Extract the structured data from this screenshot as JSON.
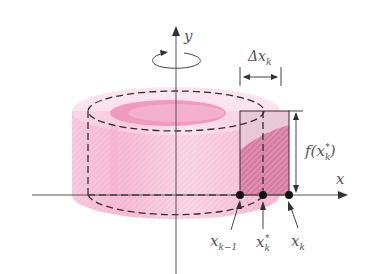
{
  "diagram": {
    "colors": {
      "shell_light": "#f6c6dc",
      "shell_mid": "#ef9fc2",
      "shell_dark": "#e77fae",
      "rect_fill": "#d98aa8",
      "rect_light": "#ebc6d4",
      "axis": "#444444",
      "dash": "#3a2a30",
      "label": "#555555"
    },
    "labels": {
      "y_axis": "y",
      "x_axis": "x",
      "delta_x": "Δx",
      "delta_x_sub": "k",
      "height_f": "f(x",
      "height_sub": "k",
      "height_sup": "*",
      "height_close": ")",
      "x_k_minus_1": "x",
      "x_k_minus_1_sub": "k−1",
      "x_k_star": "x",
      "x_k_star_sub": "k",
      "x_k_star_sup": "*",
      "x_k": "x",
      "x_k_sub": "k"
    },
    "points": [
      {
        "name": "x_k-1",
        "x": 240,
        "y": 195
      },
      {
        "name": "x_k*",
        "x": 263,
        "y": 195
      },
      {
        "name": "x_k",
        "x": 289,
        "y": 195
      }
    ]
  }
}
